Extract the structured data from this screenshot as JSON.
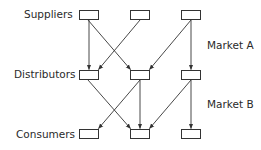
{
  "diagram": {
    "type": "supply-chain-network",
    "tiers": [
      {
        "id": "suppliers",
        "label": "Suppliers",
        "nodes": [
          "s1",
          "s2",
          "s3"
        ]
      },
      {
        "id": "distributors",
        "label": "Distributors",
        "nodes": [
          "d1",
          "d2",
          "d3"
        ]
      },
      {
        "id": "consumers",
        "label": "Consumers",
        "nodes": [
          "c1",
          "c2",
          "c3"
        ]
      }
    ],
    "markets": [
      {
        "id": "market-a",
        "label": "Market A",
        "between": [
          "suppliers",
          "distributors"
        ]
      },
      {
        "id": "market-b",
        "label": "Market B",
        "between": [
          "distributors",
          "consumers"
        ]
      }
    ],
    "edges": [
      {
        "from": "s1",
        "to": "d1"
      },
      {
        "from": "s1",
        "to": "d2"
      },
      {
        "from": "s2",
        "to": "d1"
      },
      {
        "from": "s3",
        "to": "d2"
      },
      {
        "from": "s3",
        "to": "d3"
      },
      {
        "from": "d1",
        "to": "c2"
      },
      {
        "from": "d2",
        "to": "c1"
      },
      {
        "from": "d2",
        "to": "c2"
      },
      {
        "from": "d3",
        "to": "c2"
      },
      {
        "from": "d3",
        "to": "c3"
      }
    ],
    "colors": {
      "stroke": "#333333",
      "text": "#2a2a2a",
      "background": "#ffffff"
    }
  }
}
